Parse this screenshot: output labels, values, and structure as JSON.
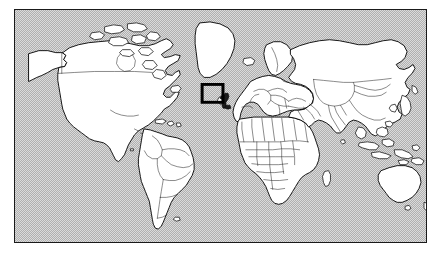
{
  "figure": {
    "kind": "world-locator-map",
    "projection": "equirectangular",
    "page_background": "#ffffff",
    "ocean_color": "#b0b0b0",
    "land_color": "#ffffff",
    "outline_color": "#000000",
    "border_color": "#2b2b2b",
    "highlight_fill": "#1c1c1c",
    "highlight_box_color": "#000000",
    "frame": {
      "x": 14,
      "y": 9,
      "width": 413,
      "height": 234
    },
    "highlight": {
      "name": "United Kingdom",
      "region": "British Isles",
      "box": {
        "x": 202,
        "y": 84,
        "width": 21,
        "height": 18
      }
    },
    "continents": [
      "North America",
      "South America",
      "Europe",
      "Africa",
      "Asia",
      "Oceania"
    ],
    "notable_landmasses": [
      "Greenland",
      "Iceland",
      "Canada",
      "United States",
      "Alaska",
      "Mexico",
      "Brazil",
      "Argentina",
      "Russia",
      "China",
      "India",
      "Australia",
      "New Zealand",
      "Japan",
      "Madagascar",
      "Indonesia",
      "Philippines",
      "Sri Lanka",
      "Papua New Guinea"
    ]
  }
}
